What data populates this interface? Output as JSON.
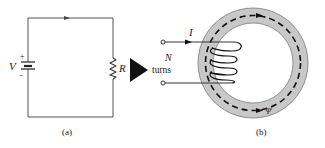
{
  "figure": {
    "panel_a": {
      "caption": "(a)",
      "voltage_label": "V",
      "plus_sign": "+",
      "minus_sign": "−",
      "resistor_label": "R",
      "current_direction": "clockwise"
    },
    "transition_arrow": "right-pointing-triangle",
    "panel_b": {
      "caption": "(b)",
      "current_label": "I",
      "turns_label_n": "N",
      "turns_label_text": "turns",
      "flux_label": "Ψ",
      "flux_direction": "clockwise",
      "core_color": "#c8c8c8"
    },
    "colors": {
      "line": "#333333",
      "core_fill": "#c8c8c8",
      "arrow_fill": "#111111",
      "background": "#ffffff"
    }
  }
}
